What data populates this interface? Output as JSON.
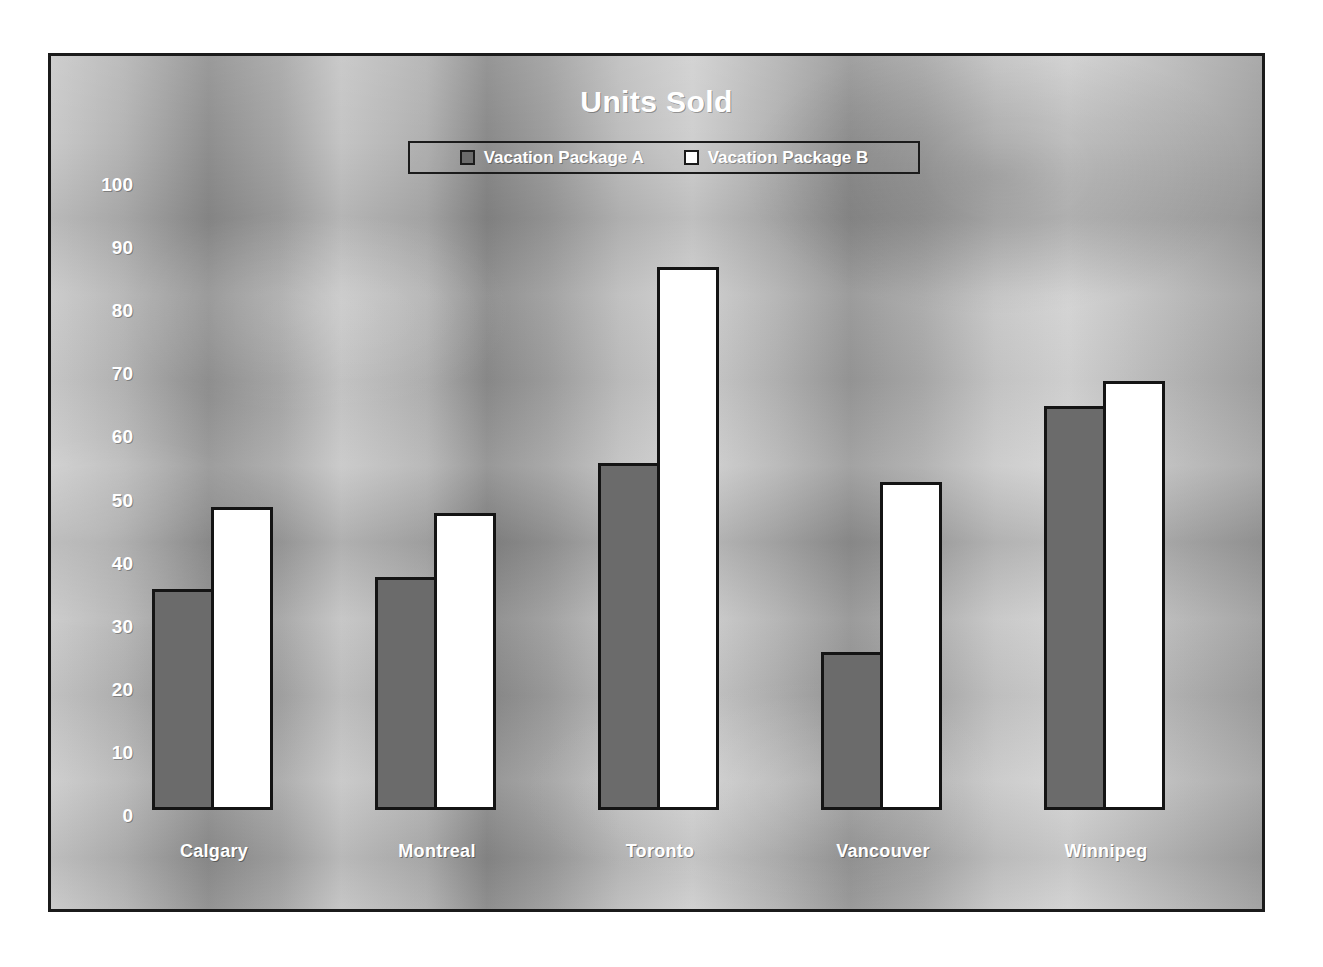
{
  "chart_data": {
    "type": "bar",
    "title": "Units Sold",
    "xlabel": "",
    "ylabel": "",
    "ylim": [
      0,
      100
    ],
    "yticks": [
      100,
      90,
      80,
      70,
      60,
      50,
      40,
      30,
      20,
      10,
      0
    ],
    "grid": false,
    "legend_position": "top-center",
    "categories": [
      "Calgary",
      "Montreal",
      "Toronto",
      "Vancouver",
      "Winnipeg"
    ],
    "series": [
      {
        "name": "Vacation Package A",
        "color": "#6b6b6b",
        "values": [
          35,
          37,
          55,
          25,
          64
        ]
      },
      {
        "name": "Vacation Package B",
        "color": "#ffffff",
        "values": [
          48,
          47,
          86,
          52,
          68
        ]
      }
    ]
  },
  "style": {
    "text_color": "#ffffff",
    "outline_color": "#141414",
    "frame_color": "#1b1b1b",
    "background": "grayscale-gradient"
  }
}
